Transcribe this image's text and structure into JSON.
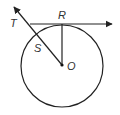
{
  "diagram": {
    "type": "geometry",
    "stroke_color": "#222222",
    "labels": {
      "T": "T",
      "R": "R",
      "S": "S",
      "O": "O"
    },
    "elements": [
      {
        "kind": "circle",
        "center": "O"
      },
      {
        "kind": "ray",
        "from": "T",
        "through": "R",
        "note": "tangent at R"
      },
      {
        "kind": "segment",
        "from": "O",
        "to": "R"
      },
      {
        "kind": "ray",
        "from": "O",
        "through": "S",
        "note": "passes through T"
      }
    ]
  }
}
